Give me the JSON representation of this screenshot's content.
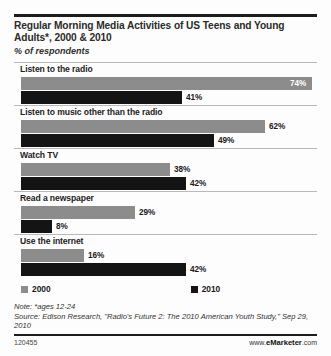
{
  "header": {
    "title": "Regular Morning Media Activities of US Teens and Young Adults*, 2000 & 2010",
    "subtitle": "% of respondents"
  },
  "legend": {
    "items": [
      {
        "label": "2000",
        "color": "#8c8c8c"
      },
      {
        "label": "2010",
        "color": "#141414"
      }
    ]
  },
  "footer": {
    "note": "Note: *ages 12-24",
    "source": "Source: Edison Research, \"Radio's Future 2: The 2010 American Youth Study,\" Sep 29, 2010",
    "id": "120455",
    "url_prefix": "www.",
    "url_brand": "eMarketer",
    "url_suffix": ".com"
  },
  "chart_data": {
    "type": "bar",
    "orientation": "horizontal",
    "title": "Regular Morning Media Activities of US Teens and Young Adults*, 2000 & 2010",
    "subtitle": "% of respondents",
    "xlabel": "",
    "ylabel": "",
    "xlim": [
      0,
      74
    ],
    "grid": false,
    "legend_position": "bottom",
    "categories": [
      "Listen to the radio",
      "Listen to music other than the radio",
      "Watch TV",
      "Read a newspaper",
      "Use the internet"
    ],
    "series": [
      {
        "name": "2000",
        "color": "#8c8c8c",
        "values": [
          74,
          62,
          38,
          29,
          16
        ],
        "labels": [
          "74%",
          "62%",
          "38%",
          "29%",
          "16%"
        ]
      },
      {
        "name": "2010",
        "color": "#141414",
        "values": [
          41,
          49,
          42,
          8,
          42
        ],
        "labels": [
          "41%",
          "49%",
          "42%",
          "8%",
          "42%"
        ]
      }
    ]
  }
}
